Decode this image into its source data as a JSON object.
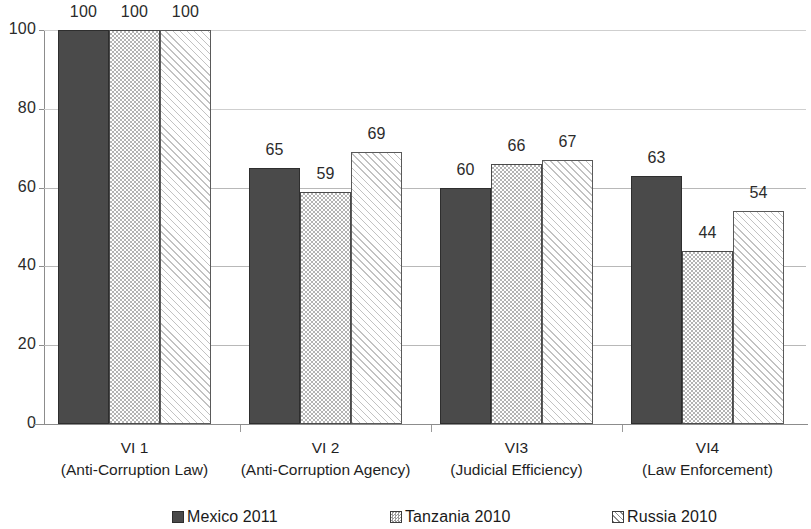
{
  "chart_data": {
    "type": "bar",
    "title": "",
    "subtitle": "",
    "xlabel": "",
    "ylabel": "",
    "ylim": [
      0,
      100
    ],
    "yticks": [
      0,
      20,
      40,
      60,
      80,
      100
    ],
    "ytick_labels": [
      "0",
      "20",
      "40",
      "60",
      "80",
      "100"
    ],
    "grid": true,
    "grid_axis": "y",
    "legend_position": "bottom",
    "show_value_labels": true,
    "categories": [
      "VI 1\n(Anti-Corruption Law)",
      "VI 2\n(Anti-Corruption Agency)",
      "VI3\n(Judicial Efficiency)",
      "VI4\n(Law Enforcement)"
    ],
    "category_lines": [
      {
        "code": "VI 1",
        "name": "(Anti-Corruption Law)"
      },
      {
        "code": "VI 2",
        "name": "(Anti-Corruption Agency)"
      },
      {
        "code": "VI3",
        "name": "(Judicial Efficiency)"
      },
      {
        "code": "VI4",
        "name": "(Law Enforcement)"
      }
    ],
    "series": [
      {
        "name": "Mexico 2011",
        "values": [
          100,
          65,
          60,
          63
        ],
        "value_labels": [
          "100",
          "65",
          "60",
          "63"
        ],
        "pattern": "solid-dark",
        "color": "#4a4a4a"
      },
      {
        "name": "Tanzania 2010",
        "values": [
          100,
          59,
          66,
          44
        ],
        "value_labels": [
          "100",
          "59",
          "66",
          "44"
        ],
        "pattern": "checker-gray",
        "color": "#b4b4b4"
      },
      {
        "name": "Russia 2010",
        "values": [
          100,
          69,
          67,
          54
        ],
        "value_labels": [
          "100",
          "69",
          "67",
          "54"
        ],
        "pattern": "diagonal-hatch-light",
        "color": "#e8e8e8"
      }
    ]
  },
  "legend": {
    "items": [
      {
        "label": "Mexico 2011",
        "swatch": "legend-swatch-mexico"
      },
      {
        "label": "Tanzania 2010",
        "swatch": "legend-swatch-tanzania"
      },
      {
        "label": "Russia 2010",
        "swatch": "legend-swatch-russia"
      }
    ]
  },
  "axis": {
    "y_tick_labels": [
      "100",
      "80",
      "60",
      "40",
      "20",
      "0"
    ]
  }
}
